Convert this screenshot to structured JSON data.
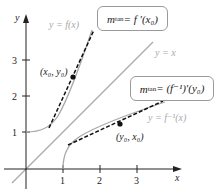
{
  "diagram": {
    "axes": {
      "x_label": "x",
      "y_label": "y",
      "x_ticks": [
        "1",
        "2",
        "3"
      ],
      "y_ticks": [
        "1",
        "2",
        "3"
      ]
    },
    "curves": {
      "f_label": "y = f(x)",
      "identity_label": "y = x",
      "finv_label": "y = f⁻¹(x)"
    },
    "points": {
      "p1_label": "(x₀, y₀)",
      "p2_label": "(y₀, x₀)"
    },
    "callouts": {
      "top": {
        "m": "m",
        "sub": "tan",
        "rhs": " = f ′(x₀)"
      },
      "bottom": {
        "m": "m",
        "sub": "tan",
        "rhs": " = (f⁻¹)′(y₀)"
      }
    },
    "colors": {
      "axis": "#222222",
      "curve": "#a8a8a8",
      "tangent": "#111111",
      "box_border": "#9a9a9a"
    }
  }
}
